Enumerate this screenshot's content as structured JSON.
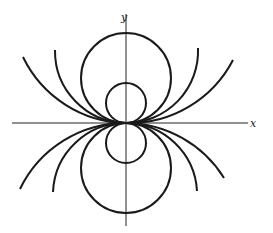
{
  "diagram": {
    "axes": {
      "x_label": "x",
      "y_label": "y"
    },
    "origin_px": [
      126,
      123
    ],
    "circles": [
      {
        "name": "small-upper",
        "radius": 20,
        "side": "upper",
        "full": true
      },
      {
        "name": "large-upper",
        "radius": 45,
        "side": "upper",
        "full": true
      },
      {
        "name": "small-lower",
        "radius": 20,
        "side": "lower",
        "full": true
      },
      {
        "name": "large-lower",
        "radius": 45,
        "side": "lower",
        "full": true
      },
      {
        "name": "arc-upper-1",
        "radius": 72,
        "side": "upper",
        "full": false
      },
      {
        "name": "arc-upper-2",
        "radius": 117,
        "side": "upper",
        "full": false
      },
      {
        "name": "arc-lower-1",
        "radius": 72,
        "side": "lower",
        "full": false
      },
      {
        "name": "arc-lower-2",
        "radius": 117,
        "side": "lower",
        "full": false
      }
    ],
    "colors": {
      "line": "#1a1a1a",
      "background": "#ffffff"
    }
  }
}
